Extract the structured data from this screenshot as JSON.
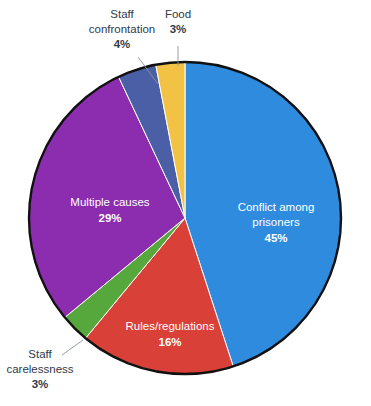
{
  "chart_data": {
    "type": "pie",
    "title": "",
    "subtitle": "",
    "xlabel": "",
    "ylabel": "",
    "legend_position": "none",
    "grid": false,
    "unit": "%",
    "start_angle_deg": 0,
    "direction": "clockwise",
    "categories": [
      "Conflict among prisoners",
      "Rules/regulations",
      "Staff carelessness",
      "Multiple causes",
      "Staff confrontation",
      "Food"
    ],
    "values": [
      45,
      16,
      3,
      29,
      4,
      3
    ],
    "colors": [
      "#2E8BDE",
      "#D94038",
      "#56A83C",
      "#8B2DAE",
      "#4A5FA5",
      "#F2C244"
    ],
    "slices": [
      {
        "label": "Conflict among prisoners",
        "label_line1": "Conflict among",
        "label_line2": "prisoners",
        "value": 45,
        "percent_text": "45%",
        "color": "#2E8BDE",
        "label_placement": "inside",
        "label_color": "#ffffff"
      },
      {
        "label": "Rules/regulations",
        "label_line1": "Rules/regulations",
        "label_line2": "",
        "value": 16,
        "percent_text": "16%",
        "color": "#D94038",
        "label_placement": "inside",
        "label_color": "#ffffff"
      },
      {
        "label": "Staff carelessness",
        "label_line1": "Staff",
        "label_line2": "carelessness",
        "value": 3,
        "percent_text": "3%",
        "color": "#56A83C",
        "label_placement": "outside",
        "label_color": "#2f3a4a"
      },
      {
        "label": "Multiple causes",
        "label_line1": "Multiple causes",
        "label_line2": "",
        "value": 29,
        "percent_text": "29%",
        "color": "#8B2DAE",
        "label_placement": "inside",
        "label_color": "#ffffff"
      },
      {
        "label": "Staff confrontation",
        "label_line1": "Staff",
        "label_line2": "confrontation",
        "value": 4,
        "percent_text": "4%",
        "color": "#4A5FA5",
        "label_placement": "outside",
        "label_color": "#2f3a4a"
      },
      {
        "label": "Food",
        "label_line1": "Food",
        "label_line2": "",
        "value": 3,
        "percent_text": "3%",
        "color": "#F2C244",
        "label_placement": "outside",
        "label_color": "#2f3a4a"
      }
    ]
  },
  "geometry": {
    "center_x": 185,
    "center_y": 218,
    "radius": 156,
    "outline_color": "#111111",
    "outline_width": 2.4,
    "background": "#ffffff"
  },
  "labels": {
    "staff_confrontation_line1": "Staff",
    "staff_confrontation_line2": "confrontation",
    "staff_confrontation_pct": "4%",
    "food_line1": "Food",
    "food_pct": "3%",
    "staff_carelessness_line1": "Staff",
    "staff_carelessness_line2": "carelessness",
    "staff_carelessness_pct": "3%",
    "conflict_line1": "Conflict among",
    "conflict_line2": "prisoners",
    "conflict_pct": "45%",
    "rules_line1": "Rules/regulations",
    "rules_pct": "16%",
    "multiple_line1": "Multiple causes",
    "multiple_pct": "29%"
  }
}
